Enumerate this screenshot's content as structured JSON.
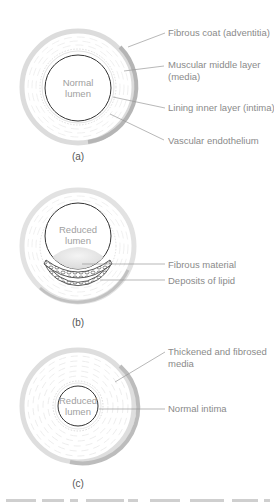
{
  "figure": {
    "panels": [
      {
        "id": "a",
        "sublabel": "(a)",
        "lumen_label": [
          "Normal",
          "lumen"
        ],
        "callouts": [
          {
            "text": [
              "Fibrous coat (adventitia)"
            ]
          },
          {
            "text": [
              "Muscular middle layer",
              "(media)"
            ]
          },
          {
            "text": [
              "Lining inner layer (intima)"
            ]
          },
          {
            "text": [
              "Vascular endothelium"
            ]
          }
        ]
      },
      {
        "id": "b",
        "sublabel": "(b)",
        "lumen_label": [
          "Reduced",
          "lumen"
        ],
        "callouts": [
          {
            "text": [
              "Fibrous material"
            ]
          },
          {
            "text": [
              "Deposits of lipid"
            ]
          }
        ]
      },
      {
        "id": "c",
        "sublabel": "(c)",
        "lumen_label": [
          "Reduced",
          "lumen"
        ],
        "callouts": [
          {
            "text": [
              "Thickened and fibrosed",
              "media"
            ]
          },
          {
            "text": [
              "Normal intima"
            ]
          }
        ]
      }
    ]
  },
  "colors": {
    "outer_ring": "#c9c9c9",
    "ring_shadow": "#a9a9a9",
    "lumen_stroke": "#333333",
    "leader_line": "#9a9a9a",
    "fibrous_fill": "#e0e0e0"
  }
}
